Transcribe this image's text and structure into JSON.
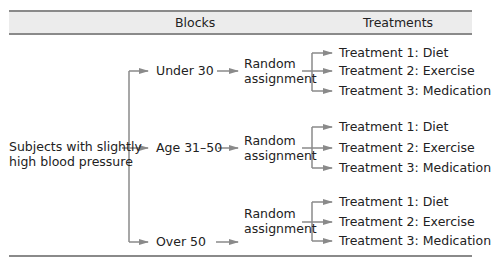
{
  "header": {
    "blocks_label": "Blocks",
    "treatments_label": "Treatments"
  },
  "subjects": {
    "line1": "Subjects with slightly",
    "line2": "high blood pressure"
  },
  "blocks": [
    {
      "label": "Under 30",
      "assignment_line1": "Random",
      "assignment_line2": "assignment",
      "treatments": [
        "Treatment 1: Diet",
        "Treatment 2: Exercise",
        "Treatment 3: Medication"
      ]
    },
    {
      "label": "Age 31–50",
      "assignment_line1": "Random",
      "assignment_line2": "assignment",
      "treatments": [
        "Treatment 1: Diet",
        "Treatment 2: Exercise",
        "Treatment 3: Medication"
      ]
    },
    {
      "label": "Over 50",
      "assignment_line1": "Random",
      "assignment_line2": "assignment",
      "treatments": [
        "Treatment 1: Diet",
        "Treatment 2: Exercise",
        "Treatment 3: Medication"
      ]
    }
  ],
  "colors": {
    "line": "#8a8a8a",
    "header_bg": "#ececec"
  }
}
